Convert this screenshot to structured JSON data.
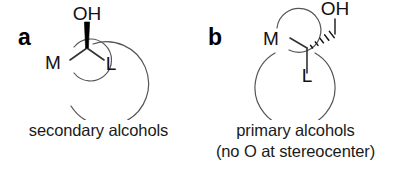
{
  "figure": {
    "background_color": "#ffffff",
    "ink_color": "#111111",
    "panels": [
      {
        "letter": "a",
        "caption_lines": [
          "secondary alcohols"
        ],
        "atoms": {
          "hydroxyl": "OH",
          "medium_group": "M",
          "large_group": "L"
        },
        "bond_to_hydroxyl_style": "bold-wedge",
        "description": "secondary alcohol stereocenter bearing OH on a bold wedge, with medium (M) and large (L) substituents enclosed in open circles"
      },
      {
        "letter": "b",
        "caption_lines": [
          "primary alcohols",
          "(no O at stereocenter)"
        ],
        "atoms": {
          "hydroxyl": "OH",
          "medium_group": "M",
          "large_group": "L"
        },
        "bond_to_hydroxyl_style": "hashed-wedge",
        "description": "primary alcohol with stereocenter adjacent to the carbinol carbon, CH2OH drawn on a hashed wedge, medium (M) and large (L) substituents in open circles"
      }
    ]
  },
  "colors": {
    "background": "#ffffff",
    "bond_line": "#333333",
    "bold_bond": "#000000",
    "circle_outline": "#555555",
    "text": "#1a1a1a"
  }
}
